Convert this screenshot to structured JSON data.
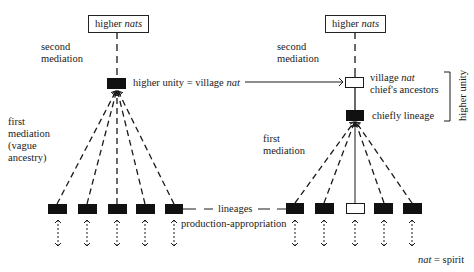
{
  "left": {
    "top_box": {
      "prefix": "higher ",
      "italic": "nats"
    },
    "second_mediation": [
      "second",
      "mediation"
    ],
    "unity_label": {
      "prefix": "higher unity = village ",
      "italic": "nat"
    },
    "first_mediation": [
      "first",
      "mediation",
      "(vague",
      "ancestry)"
    ],
    "bottom_boxes": 5
  },
  "right": {
    "top_box": {
      "prefix": "higher ",
      "italic": "nats"
    },
    "second_mediation": [
      "second",
      "mediation"
    ],
    "village_label": {
      "prefix": "village ",
      "italic": "nat",
      "line2": "chief's ancestors"
    },
    "chiefly_label": "chiefly lineage",
    "bracket_label": "higher unity",
    "first_mediation": [
      "first",
      "mediation"
    ],
    "bottom_boxes": 5,
    "open_box_index": 2
  },
  "center": {
    "lineages": "lineages",
    "production": "production-appropriation"
  },
  "legend": {
    "italic": "nat",
    "rest": " = spirit"
  },
  "colors": {
    "ink": "#1a1a1a",
    "background": "#ffffff"
  }
}
